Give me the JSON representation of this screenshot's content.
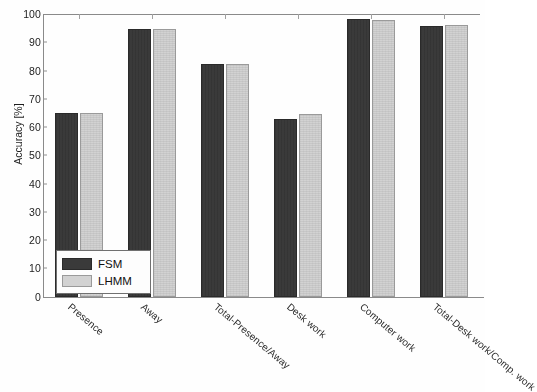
{
  "chart_data": {
    "type": "bar",
    "title": "",
    "xlabel": "",
    "ylabel": "Accuracy [%]",
    "ylim": [
      0,
      100
    ],
    "yticks": [
      0,
      10,
      20,
      30,
      40,
      50,
      60,
      70,
      80,
      90,
      100
    ],
    "ytick_labels": [
      "0",
      "10",
      "20",
      "30",
      "40",
      "50",
      "60",
      "70",
      "80",
      "90",
      "100"
    ],
    "grid": false,
    "legend_position": "lower left (inside axes)",
    "categories": [
      "Presence",
      "Away",
      "Total-Presence/Away",
      "Desk work",
      "Computer work",
      "Total-Desk work/Comp. work"
    ],
    "series": [
      {
        "name": "FSM",
        "color": "#3a3a3a",
        "values": [
          64.8,
          94.7,
          82.4,
          62.7,
          98.2,
          95.7
        ]
      },
      {
        "name": "LHMM",
        "color": "#d2d2d2",
        "values": [
          64.8,
          94.7,
          82.4,
          64.7,
          97.8,
          96.0
        ]
      }
    ]
  },
  "legend": {
    "entries": [
      {
        "label": "FSM",
        "swatch": "dark-gray-swatch"
      },
      {
        "label": "LHMM",
        "swatch": "light-gray-swatch"
      }
    ]
  }
}
